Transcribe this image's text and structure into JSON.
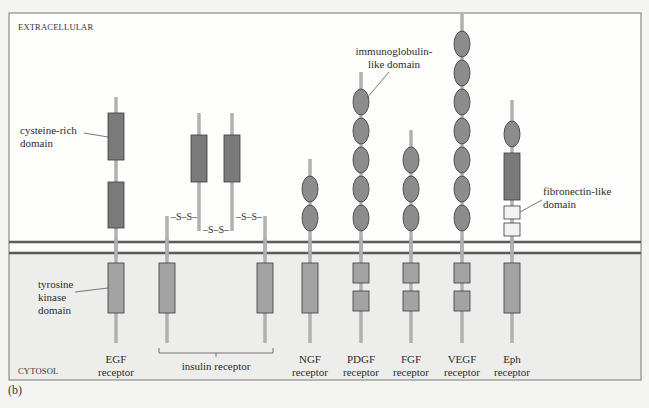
{
  "figure": {
    "panel_top_letter": "(a)",
    "panel_letter": "(b)",
    "regions": {
      "extracellular": "EXTRACELLULAR",
      "cytosol": "CYTOSOL"
    },
    "colors": {
      "background": "#f4f4f2",
      "extracellular_fill": "#fdfdfc",
      "cytosol_fill": "#ededeb",
      "frame": "#8a8a8a",
      "membrane": "#5a5a5a",
      "stalk": "#b0b0b0",
      "cysteine_rich": "#7a7a7a",
      "ig_domain": "#8c8c8c",
      "kinase": "#a3a3a3",
      "fibronectin": "#f2f2f2",
      "outline": "#3a3a3a"
    },
    "annotations": [
      {
        "id": "cysteine",
        "lines": [
          "cysteine-rich",
          "domain"
        ]
      },
      {
        "id": "kinase",
        "lines": [
          "tyrosine",
          "kinase",
          "domain"
        ]
      },
      {
        "id": "ig",
        "lines": [
          "immunoglobulin-",
          "like domain"
        ]
      },
      {
        "id": "fibronectin",
        "lines": [
          "fibronectin-like",
          "domain"
        ]
      }
    ],
    "disulfide_label": "–S–S–",
    "receptors": [
      {
        "name": "EGF receptor",
        "line1": "EGF",
        "line2": "receptor",
        "x": 116,
        "extracellular": [
          "cysteine-rich",
          "cysteine-rich"
        ],
        "kinase": "single"
      },
      {
        "name": "insulin receptor",
        "label": "insulin receptor",
        "chains": [
          167,
          199,
          232,
          265
        ],
        "extracellular": [
          "cysteine-rich"
        ],
        "kinase": "single"
      },
      {
        "name": "NGF receptor",
        "line1": "NGF",
        "line2": "receptor",
        "x": 310,
        "ig_count": 2,
        "kinase": "single"
      },
      {
        "name": "PDGF receptor",
        "line1": "PDGF",
        "line2": "receptor",
        "x": 361,
        "ig_count": 5,
        "kinase": "split"
      },
      {
        "name": "FGF receptor",
        "line1": "FGF",
        "line2": "receptor",
        "x": 411,
        "ig_count": 3,
        "kinase": "split"
      },
      {
        "name": "VEGF receptor",
        "line1": "VEGF",
        "line2": "receptor",
        "x": 462,
        "ig_count": 7,
        "kinase": "split"
      },
      {
        "name": "Eph receptor",
        "line1": "Eph",
        "line2": "receptor",
        "x": 512,
        "extracellular": [
          "ig",
          "cysteine-rich",
          "fibronectin",
          "fibronectin"
        ],
        "kinase": "single"
      }
    ]
  }
}
